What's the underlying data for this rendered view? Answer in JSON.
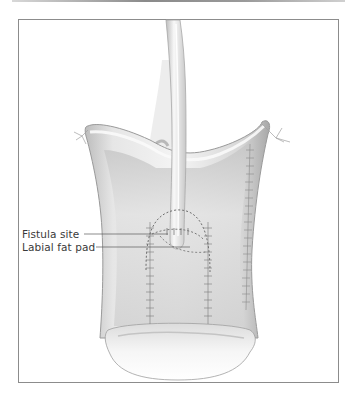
{
  "figure": {
    "type": "surgical-illustration",
    "labels": [
      {
        "text": "Fistula site"
      },
      {
        "text": "Labial fat pad"
      }
    ],
    "colors": {
      "frame": "#8c8c8c",
      "tissue_light": "#f2f2f2",
      "tissue_mid": "#cfcfcf",
      "tissue_dark": "#9c9c9c",
      "suture": "#7a7a7a",
      "label_text": "#3a3a3a"
    }
  }
}
